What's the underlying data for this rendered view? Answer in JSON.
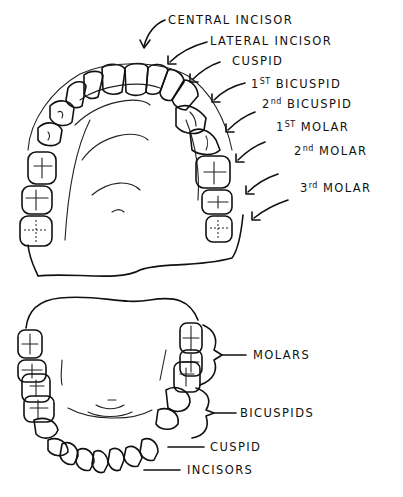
{
  "diagram": {
    "upper_arch": {
      "name": "Upper jaw (maxillary arch)",
      "labels": [
        {
          "id": "central-incisor",
          "text": "CENTRAL INCISOR",
          "x": 168,
          "y": 15
        },
        {
          "id": "lateral-incisor",
          "text": "LATERAL INCISOR",
          "x": 210,
          "y": 36
        },
        {
          "id": "cuspid",
          "text": "CUSPID",
          "x": 232,
          "y": 56
        },
        {
          "id": "first-bicuspid",
          "ord": "1",
          "sup": "ST",
          "text": " BICUSPID",
          "x": 251,
          "y": 80
        },
        {
          "id": "second-bicuspid",
          "ord": "2",
          "sup": "nd",
          "text": " BICUSPID",
          "x": 262,
          "y": 100
        },
        {
          "id": "first-molar",
          "ord": "1",
          "sup": "ST",
          "text": " MOLAR",
          "x": 276,
          "y": 123
        },
        {
          "id": "second-molar",
          "ord": "2",
          "sup": "nd",
          "text": " MOLAR",
          "x": 294,
          "y": 147
        },
        {
          "id": "third-molar",
          "ord": "3",
          "sup": "rd",
          "text": " MOLAR",
          "x": 300,
          "y": 184
        }
      ]
    },
    "lower_arch": {
      "name": "Lower jaw (mandibular arch)",
      "labels": [
        {
          "id": "molars",
          "text": "MOLARS",
          "x": 253,
          "y": 350
        },
        {
          "id": "bicuspids",
          "text": "BICUSPIDS",
          "x": 240,
          "y": 412
        },
        {
          "id": "cuspid",
          "text": "CUSPID",
          "x": 210,
          "y": 444
        },
        {
          "id": "incisors",
          "text": "INCISORS",
          "x": 187,
          "y": 468
        }
      ]
    },
    "colors": {
      "ink": "#111111",
      "background": "#ffffff"
    }
  }
}
